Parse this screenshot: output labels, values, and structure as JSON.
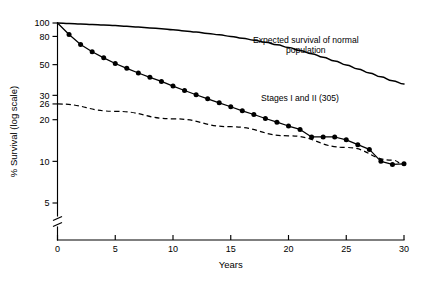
{
  "chart_data": {
    "type": "line",
    "title": "",
    "xlabel": "Years",
    "ylabel": "% Survival (log scale)",
    "yscale": "log",
    "xlim": [
      0,
      30
    ],
    "ylim": [
      4.2,
      100
    ],
    "grid": false,
    "legend": "annotations-inline",
    "axis_break": {
      "axis": "y",
      "below": 5,
      "label": "axis-break"
    },
    "xticks": [
      0,
      5,
      10,
      15,
      20,
      25,
      30
    ],
    "xtick_labels": [
      "0",
      "5",
      "10",
      "15",
      "20",
      "25",
      "30"
    ],
    "yticks": [
      100,
      80,
      50,
      30,
      26,
      20,
      10,
      5
    ],
    "ytick_labels": [
      "100",
      "80",
      "50",
      "30",
      "26",
      "20",
      "10",
      "5"
    ],
    "annotations": [
      {
        "text_line1": "Expected survival of normal",
        "text_line2": "population",
        "x": 21.5,
        "y": 72
      },
      {
        "text_line1": "Stages I and II (305)",
        "text_line2": "",
        "x": 21.0,
        "y": 27.5
      }
    ],
    "series": [
      {
        "name": "Expected survival of normal population",
        "style": "solid-thick",
        "markers": false,
        "x": [
          0,
          1,
          2,
          3,
          4,
          5,
          6,
          7,
          8,
          9,
          10,
          11,
          12,
          13,
          14,
          15,
          16,
          17,
          18,
          19,
          20,
          21,
          22,
          23,
          24,
          25,
          26,
          27,
          28,
          29,
          30
        ],
        "values": [
          100,
          99.3,
          98.5,
          97.7,
          96.8,
          95.8,
          94.7,
          93.5,
          92.2,
          90.8,
          89.3,
          87.7,
          86.0,
          84.1,
          82.1,
          80.0,
          77.7,
          75.2,
          72.5,
          69.6,
          66.5,
          63.3,
          60.0,
          56.6,
          53.2,
          49.8,
          46.6,
          43.6,
          40.8,
          38.3,
          36.2
        ]
      },
      {
        "name": "Stages I and II (305)",
        "style": "solid-markers",
        "markers": true,
        "x": [
          0,
          1,
          2,
          3,
          4,
          5,
          6,
          7,
          8,
          9,
          10,
          11,
          12,
          13,
          14,
          15,
          16,
          17,
          18,
          19,
          20,
          21,
          22,
          23,
          24,
          25,
          26,
          27,
          28,
          29,
          30
        ],
        "values": [
          100,
          82.5,
          70.0,
          62.0,
          56.0,
          51.0,
          47.0,
          43.5,
          40.5,
          37.8,
          35.0,
          32.5,
          30.3,
          28.3,
          26.5,
          24.8,
          23.2,
          21.8,
          20.4,
          19.2,
          18.0,
          17.0,
          15.0,
          15.0,
          15.0,
          14.3,
          13.2,
          12.2,
          10.0,
          9.5,
          9.6
        ]
      },
      {
        "name": "Lower reference (dashed)",
        "style": "dashed",
        "markers": false,
        "x": [
          0,
          5,
          10,
          15,
          20,
          25,
          29,
          30
        ],
        "values": [
          26.0,
          23.0,
          20.3,
          17.8,
          15.3,
          12.6,
          10.2,
          9.5
        ]
      }
    ]
  },
  "axis_titles": {
    "x": "Years",
    "y": "% Survival (log scale)"
  }
}
